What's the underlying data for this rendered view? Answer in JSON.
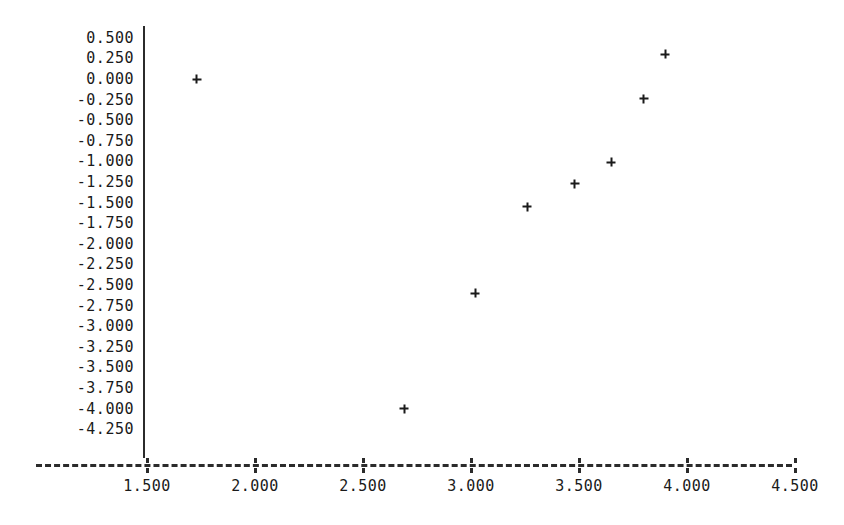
{
  "chart_data": {
    "type": "scatter",
    "title": "",
    "xlabel": "",
    "ylabel": "",
    "marker": "+",
    "marker_color": "#1a1a1a",
    "grid": false,
    "legend": null,
    "xlim": [
      1.25,
      4.75
    ],
    "ylim": [
      -4.375,
      0.625
    ],
    "x_tick_labels": [
      "1.500",
      "2.000",
      "2.500",
      "3.000",
      "3.500",
      "4.000",
      "4.500"
    ],
    "x_ticks": [
      1.5,
      2.0,
      2.5,
      3.0,
      3.5,
      4.0,
      4.5
    ],
    "y_tick_labels": [
      "0.500",
      "0.250",
      "0.000",
      "-0.250",
      "-0.500",
      "-0.750",
      "-1.000",
      "-1.250",
      "-1.500",
      "-1.750",
      "-2.000",
      "-2.250",
      "-2.500",
      "-2.750",
      "-3.000",
      "-3.250",
      "-3.500",
      "-3.750",
      "-4.000",
      "-4.250"
    ],
    "y_ticks": [
      0.5,
      0.25,
      0.0,
      -0.25,
      -0.5,
      -0.75,
      -1.0,
      -1.25,
      -1.5,
      -1.75,
      -2.0,
      -2.25,
      -2.5,
      -2.75,
      -3.0,
      -3.25,
      -3.5,
      -3.75,
      -4.0,
      -4.25
    ],
    "points": [
      {
        "x": 1.73,
        "y": 0.0
      },
      {
        "x": 2.69,
        "y": -4.0
      },
      {
        "x": 3.02,
        "y": -2.6
      },
      {
        "x": 3.26,
        "y": -1.55
      },
      {
        "x": 3.48,
        "y": -1.27
      },
      {
        "x": 3.65,
        "y": -1.01
      },
      {
        "x": 3.8,
        "y": -0.24
      },
      {
        "x": 3.9,
        "y": 0.3
      }
    ]
  },
  "axes": {
    "y_axis_color": "#2b2b2b",
    "x_axis_color": "#2b2b2b",
    "x_axis_style": "dashed",
    "y_axis_style": "solid"
  }
}
